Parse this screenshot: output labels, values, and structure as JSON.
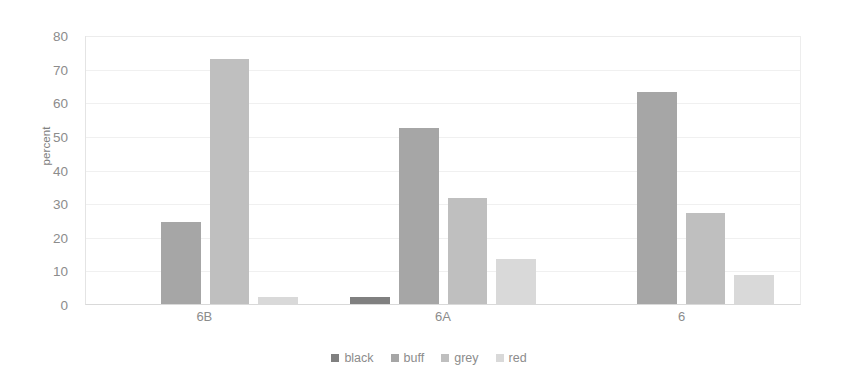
{
  "chart_data": {
    "type": "bar",
    "title": "",
    "xlabel": "",
    "ylabel": "percent",
    "categories": [
      "6B",
      "6A",
      "6"
    ],
    "series": [
      {
        "name": "black",
        "color": "#808080",
        "values": [
          0,
          2,
          0
        ]
      },
      {
        "name": "buff",
        "color": "#a6a6a6",
        "values": [
          24.3,
          52.2,
          63
        ]
      },
      {
        "name": "grey",
        "color": "#bfbfbf",
        "values": [
          73,
          31.5,
          27
        ]
      },
      {
        "name": "red",
        "color": "#d9d9d9",
        "values": [
          2.2,
          13.5,
          8.5
        ]
      }
    ],
    "ylim": [
      0,
      80
    ],
    "yticks": [
      0,
      10,
      20,
      30,
      40,
      50,
      60,
      70,
      80
    ],
    "ytick_labels": [
      "0",
      "10",
      "20",
      "30",
      "40",
      "50",
      "60",
      "70",
      "80"
    ],
    "grid": "horizontal",
    "legend_position": "bottom",
    "legend_orientation": "horizontal",
    "bar_group_order": [
      "black",
      "buff",
      "grey",
      "red"
    ]
  },
  "axis": {
    "y_title": "percent"
  }
}
